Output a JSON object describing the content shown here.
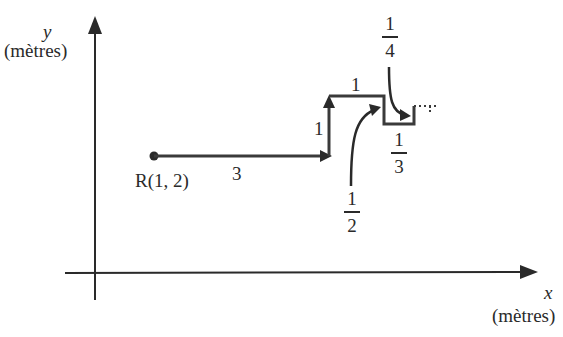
{
  "axes": {
    "y_label": "y",
    "y_unit": "(mètres)",
    "x_label": "x",
    "x_unit": "(mètres)"
  },
  "start_point": {
    "label": "R(1, 2)"
  },
  "segments": [
    {
      "direction": "right",
      "length_label": "3"
    },
    {
      "direction": "up",
      "length_label": "1"
    },
    {
      "direction": "right",
      "length_label": "1"
    },
    {
      "direction": "down",
      "length_label": {
        "num": "1",
        "den": "2"
      }
    },
    {
      "direction": "right",
      "length_label": {
        "num": "1",
        "den": "3"
      }
    },
    {
      "direction": "up",
      "length_label": {
        "num": "1",
        "den": "4"
      }
    },
    {
      "direction": "right",
      "style": "dotted",
      "length_label": "…"
    }
  ],
  "colors": {
    "ink": "#2a2a2a",
    "path": "#3a3a3a",
    "background": "#ffffff"
  }
}
